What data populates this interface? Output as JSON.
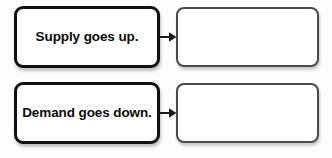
{
  "diagram": {
    "type": "cause-effect-flow",
    "background_color": "#fdfdfd",
    "rows": [
      {
        "prompt": {
          "label": "Supply goes up.",
          "border_color": "#111111",
          "fill_color": "#ffffff"
        },
        "connector": {
          "icon": "arrow-right-icon",
          "color": "#1a1a1a"
        },
        "answer": {
          "label": "",
          "border_color": "#4a4a4a",
          "fill_color": "#ffffff"
        }
      },
      {
        "prompt": {
          "label": "Demand goes down.",
          "border_color": "#111111",
          "fill_color": "#ffffff"
        },
        "connector": {
          "icon": "arrow-right-icon",
          "color": "#1a1a1a"
        },
        "answer": {
          "label": "",
          "border_color": "#4a4a4a",
          "fill_color": "#ffffff"
        }
      }
    ]
  }
}
